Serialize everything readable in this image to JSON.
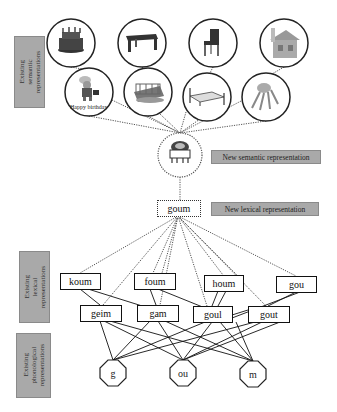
{
  "labels": {
    "existing_semantic": "Existing\nsemantic\nrepresentations",
    "existing_lexical": "Existing\nlexical\nrepresentations",
    "existing_phonological": "Existing\nphonological\nrepresentations",
    "new_semantic": "New semantic representation",
    "new_lexical": "New lexical representation"
  },
  "semantic_nodes": {
    "top_row": [
      {
        "icon": "birthday-cake-icon"
      },
      {
        "icon": "table-icon"
      },
      {
        "icon": "chair-icon"
      },
      {
        "icon": "house-icon"
      }
    ],
    "second_row": [
      {
        "icon": "smurf-figure-icon",
        "caption": "Happy birthday"
      },
      {
        "icon": "crib-icon"
      },
      {
        "icon": "bed-icon"
      },
      {
        "icon": "lobster-icon"
      }
    ],
    "new": {
      "icon": "novel-object-icon"
    }
  },
  "lexical": {
    "new": "goum",
    "top_row": [
      "koum",
      "foum",
      "houm",
      "gou"
    ],
    "second_row": [
      "geim",
      "gam",
      "goul",
      "gout"
    ]
  },
  "phonological": [
    "g",
    "ou",
    "m"
  ],
  "colors": {
    "label_bg": "#a9a9a9",
    "line": "#111111",
    "dotted": "#444444"
  }
}
